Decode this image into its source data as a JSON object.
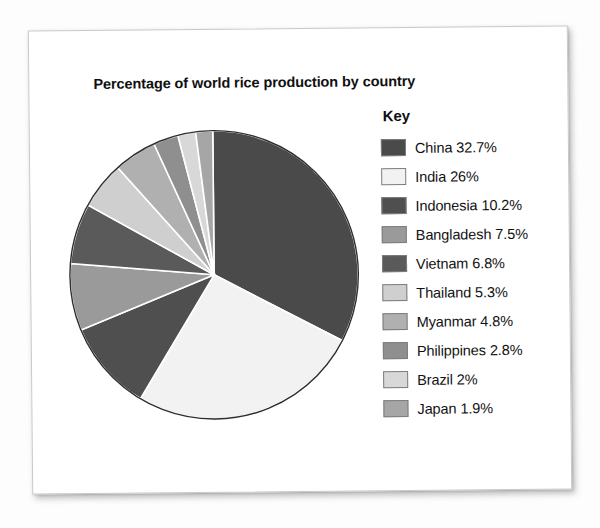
{
  "page": {
    "title": "Percentage of world rice production by country"
  },
  "legend": {
    "heading": "Key"
  },
  "chart_data": {
    "type": "pie",
    "title": "Percentage of world rice production by country",
    "xlabel": "",
    "ylabel": "",
    "legend_position": "right",
    "legend_title": "Key",
    "start_angle_deg": 0,
    "direction": "clockwise",
    "unit": "%",
    "categories": [
      "China",
      "India",
      "Indonesia",
      "Bangladesh",
      "Vietnam",
      "Thailand",
      "Myanmar",
      "Philippines",
      "Brazil",
      "Japan"
    ],
    "values": [
      32.7,
      26,
      10.2,
      7.5,
      6.8,
      5.3,
      4.8,
      2.8,
      2,
      1.9
    ],
    "labels": [
      "China 32.7%",
      "India 26%",
      "Indonesia 10.2%",
      "Bangladesh 7.5%",
      "Vietnam 6.8%",
      "Thailand 5.3%",
      "Myanmar 4.8%",
      "Philippines 2.8%",
      "Brazil 2%",
      "Japan 1.9%"
    ],
    "colors": [
      "#4a4a4a",
      "#f2f2f2",
      "#4f4f4f",
      "#9a9a9a",
      "#5a5a5a",
      "#cfcfcf",
      "#b0b0b0",
      "#8f8f8f",
      "#d8d8d8",
      "#a6a6a6"
    ],
    "slices": [
      {
        "name": "China",
        "value": 32.7,
        "label": "China 32.7%",
        "color": "#4a4a4a"
      },
      {
        "name": "India",
        "value": 26,
        "label": "India 26%",
        "color": "#f2f2f2"
      },
      {
        "name": "Indonesia",
        "value": 10.2,
        "label": "Indonesia 10.2%",
        "color": "#4f4f4f"
      },
      {
        "name": "Bangladesh",
        "value": 7.5,
        "label": "Bangladesh 7.5%",
        "color": "#9a9a9a"
      },
      {
        "name": "Vietnam",
        "value": 6.8,
        "label": "Vietnam 6.8%",
        "color": "#5a5a5a"
      },
      {
        "name": "Thailand",
        "value": 5.3,
        "label": "Thailand 5.3%",
        "color": "#cfcfcf"
      },
      {
        "name": "Myanmar",
        "value": 4.8,
        "label": "Myanmar 4.8%",
        "color": "#b0b0b0"
      },
      {
        "name": "Philippines",
        "value": 2.8,
        "label": "Philippines 2.8%",
        "color": "#8f8f8f"
      },
      {
        "name": "Brazil",
        "value": 2,
        "label": "Brazil 2%",
        "color": "#d8d8d8"
      },
      {
        "name": "Japan",
        "value": 1.9,
        "label": "Japan 1.9%",
        "color": "#a6a6a6"
      }
    ]
  }
}
